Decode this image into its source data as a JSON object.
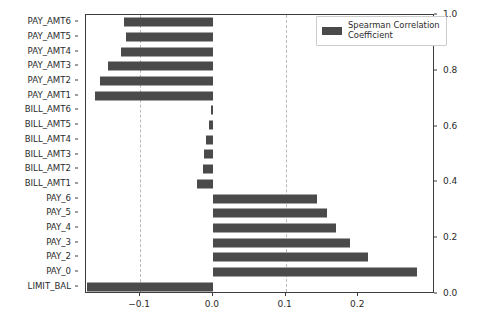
{
  "chart_data": {
    "type": "bar",
    "orientation": "horizontal",
    "title": "",
    "xlabel": "",
    "ylabel": "",
    "xlim": [
      -0.1745,
      0.3055
    ],
    "xticks": [
      -0.1,
      0.0,
      0.1,
      0.2
    ],
    "xtick_labels": [
      "−0.1",
      "0.0",
      "0.1",
      "0.2"
    ],
    "right_axis": {
      "ylim": [
        0.0,
        1.0
      ],
      "ticks": [
        0.0,
        0.2,
        0.4,
        0.6,
        0.8,
        1.0
      ],
      "tick_labels": [
        "0.0",
        "0.2",
        "0.4",
        "0.6",
        "0.8",
        "1.0"
      ]
    },
    "grid": false,
    "reference_lines": [
      -0.1,
      0.1
    ],
    "reference_line_style": "dashed",
    "bar_color": "#4a4a4a",
    "legend": {
      "position": "upper right",
      "entries": [
        {
          "label": "Spearman Correlation Coefficient",
          "color": "#4a4a4a"
        }
      ]
    },
    "categories": [
      "PAY_AMT6",
      "PAY_AMT5",
      "PAY_AMT4",
      "PAY_AMT3",
      "PAY_AMT2",
      "PAY_AMT1",
      "BILL_AMT6",
      "BILL_AMT5",
      "BILL_AMT4",
      "BILL_AMT3",
      "BILL_AMT2",
      "BILL_AMT1",
      "PAY_6",
      "PAY_5",
      "PAY_4",
      "PAY_3",
      "PAY_2",
      "PAY_0",
      "LIMIT_BAL"
    ],
    "values": [
      -0.122,
      -0.12,
      -0.127,
      -0.144,
      -0.155,
      -0.162,
      -0.002,
      -0.006,
      -0.01,
      -0.012,
      -0.014,
      -0.022,
      0.143,
      0.157,
      0.17,
      0.188,
      0.213,
      0.281,
      -0.173
    ]
  }
}
